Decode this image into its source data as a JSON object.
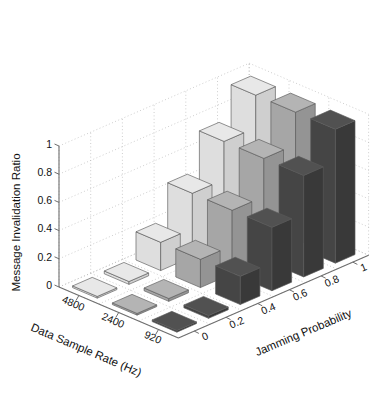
{
  "chart_data": {
    "type": "bar",
    "subtype": "bar3-grouped-3d",
    "title": "",
    "xlabel": "Data Sample Rate (Hz)",
    "ylabel": "Jamming Probability",
    "zlabel": "Message Invalidation Ratio",
    "x_categories": [
      "4800",
      "2400",
      "920"
    ],
    "y_categories": [
      "0",
      "0.2",
      "0.4",
      "0.6",
      "0.8",
      "1"
    ],
    "x_tick_labels": [
      "4800",
      "2400",
      "920"
    ],
    "y_tick_labels": [
      "0",
      "0.2",
      "0.4",
      "0.6",
      "0.8",
      "1"
    ],
    "z_tick_labels": [
      "0",
      "0.2",
      "0.4",
      "0.6",
      "0.8",
      "1"
    ],
    "zlim": [
      0,
      1
    ],
    "grid": true,
    "legend": "none",
    "series": [
      {
        "name": "4800",
        "color": "#e4e4e4",
        "values": [
          0.0,
          0.02,
          0.2,
          0.45,
          0.72,
          0.95
        ]
      },
      {
        "name": "2400",
        "color": "#a8a8a8",
        "values": [
          0.0,
          0.02,
          0.2,
          0.45,
          0.72,
          0.95
        ]
      },
      {
        "name": "920",
        "color": "#4a4a4a",
        "values": [
          0.0,
          0.02,
          0.2,
          0.45,
          0.72,
          0.95
        ]
      }
    ],
    "colors": {
      "series_light_top": "#e8e8e8",
      "series_light_left": "#dedede",
      "series_light_right": "#cfcfcf",
      "series_mid_top": "#b4b4b4",
      "series_mid_left": "#a6a6a6",
      "series_mid_right": "#949494",
      "series_dark_top": "#515151",
      "series_dark_left": "#454545",
      "series_dark_right": "#393939",
      "axis": "#6e6e6e",
      "grid": "#b9b9b9",
      "edge": "#5a5a5a",
      "text": "#111111",
      "background": "#ffffff"
    }
  },
  "axes": {
    "z": {
      "label": "Message Invalidation Ratio",
      "ticks": [
        "1",
        "0.8",
        "0.6",
        "0.4",
        "0.2",
        "0"
      ]
    },
    "x": {
      "label": "Data Sample Rate (Hz)",
      "ticks": [
        "4800",
        "2400",
        "920"
      ]
    },
    "y": {
      "label": "Jamming Probability",
      "ticks": [
        "0",
        "0.2",
        "0.4",
        "0.6",
        "0.8",
        "1"
      ]
    }
  }
}
